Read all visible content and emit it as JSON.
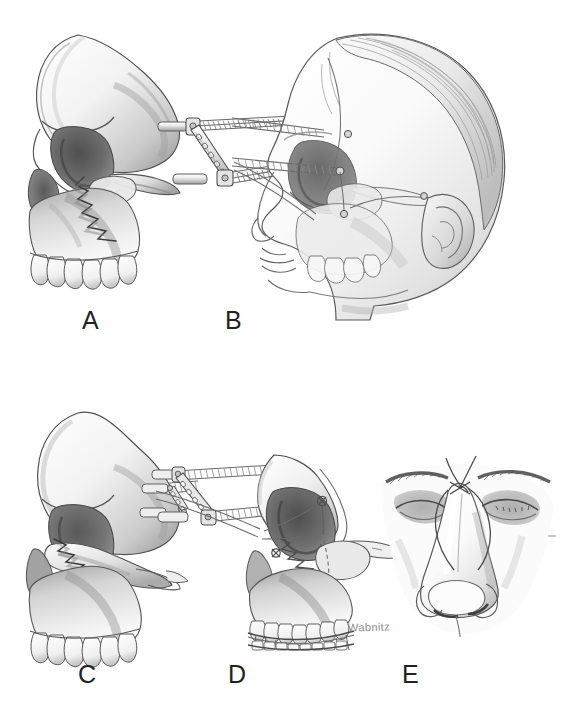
{
  "figure": {
    "medium": "graphite pencil medical illustration",
    "background_color": "#ffffff",
    "ink_color": "#222222",
    "artist_signature": "Wabnitz",
    "width": 582,
    "height": 709
  },
  "panels": [
    {
      "id": "A",
      "label": "A",
      "label_x": 90,
      "label_y": 322,
      "caption_subject": "lateral skull with displaced Le Fort midface fracture",
      "elements": [
        "cranial vault",
        "orbit",
        "zygomatic arch",
        "maxilla",
        "maxillary teeth",
        "zigzag fracture line"
      ]
    },
    {
      "id": "B",
      "label": "B",
      "label_x": 233,
      "label_y": 322,
      "caption_subject": "patient profile with ghosted skull and external fixator pins in place",
      "elements": [
        "head profile",
        "hair",
        "ear",
        "ghosted skull",
        "threaded halo pins",
        "perforated connecting bar",
        "orbital wires"
      ]
    },
    {
      "id": "C",
      "label": "C",
      "label_x": 86,
      "label_y": 676,
      "caption_subject": "skull with mobile midface segment prior to reduction",
      "elements": [
        "cranial vault",
        "orbit",
        "detached midface segment",
        "fracture line",
        "maxillary teeth",
        "detached fixator pins"
      ]
    },
    {
      "id": "D",
      "label": "D",
      "label_x": 236,
      "label_y": 676,
      "caption_subject": "reduced fracture secured with interosseous wires, external fixator and arch bars",
      "elements": [
        "reduced midface",
        "interosseous wires",
        "external fixator bar",
        "threaded pins",
        "maxillary arch bar",
        "mandibular arch bar",
        "intermaxillary fixation wires"
      ]
    },
    {
      "id": "E",
      "label": "E",
      "label_x": 410,
      "label_y": 676,
      "caption_subject": "frontal view of nasal root with transnasal wiring",
      "elements": [
        "nose",
        "eyes",
        "eyebrows",
        "transnasal wire",
        "nasal dorsum"
      ]
    }
  ],
  "signature": {
    "text": "Wabnitz",
    "x": 348,
    "y": 622
  },
  "palette": {
    "paper": "#ffffff",
    "outline": "#4a4a4a",
    "midtone": "#9a9a9a",
    "shadow": "#5d5d5d",
    "deep_shadow": "#3a3a3a",
    "highlight": "#f2f2f2",
    "hardware": "#b4b4b4",
    "label_ink": "#222222",
    "signature_ink": "#8d8d8d"
  }
}
